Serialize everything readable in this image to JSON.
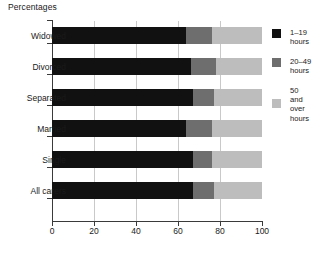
{
  "chart_data": {
    "type": "bar",
    "orientation": "horizontal",
    "stacked": true,
    "stack_mode": "percent",
    "title": "Percentages",
    "xlabel": "",
    "ylabel": "",
    "xlim": [
      0,
      100
    ],
    "xticks": [
      0,
      20,
      40,
      60,
      80,
      100
    ],
    "grid": true,
    "grid_axis": "x",
    "legend_position": "right",
    "categories": [
      "Widowed",
      "Divorced",
      "Separated",
      "Married",
      "Single",
      "All carers"
    ],
    "series": [
      {
        "name": "1–19 hours",
        "color": "#111111",
        "values": [
          64,
          66,
          67,
          64,
          67,
          67
        ]
      },
      {
        "name": "20–49 hours",
        "color": "#6e6e6e",
        "values": [
          12,
          12,
          10,
          12,
          9,
          10
        ]
      },
      {
        "name": "50 and over hours",
        "color": "#bdbdbd",
        "values": [
          24,
          22,
          23,
          24,
          24,
          23
        ]
      }
    ]
  },
  "legend": {
    "items": [
      {
        "label": "1–19\nhours",
        "color": "#111111"
      },
      {
        "label": "20–49\nhours",
        "color": "#6e6e6e"
      },
      {
        "label": "50\nand\nover\nhours",
        "color": "#bdbdbd"
      }
    ]
  },
  "axis": {
    "x_tick_labels": [
      "0",
      "20",
      "40",
      "60",
      "80",
      "100"
    ]
  },
  "colors": {
    "axis": "#3a3a3a",
    "gridline": "#c9c9c9",
    "background": "#ffffff",
    "text": "#1a1a1a"
  }
}
